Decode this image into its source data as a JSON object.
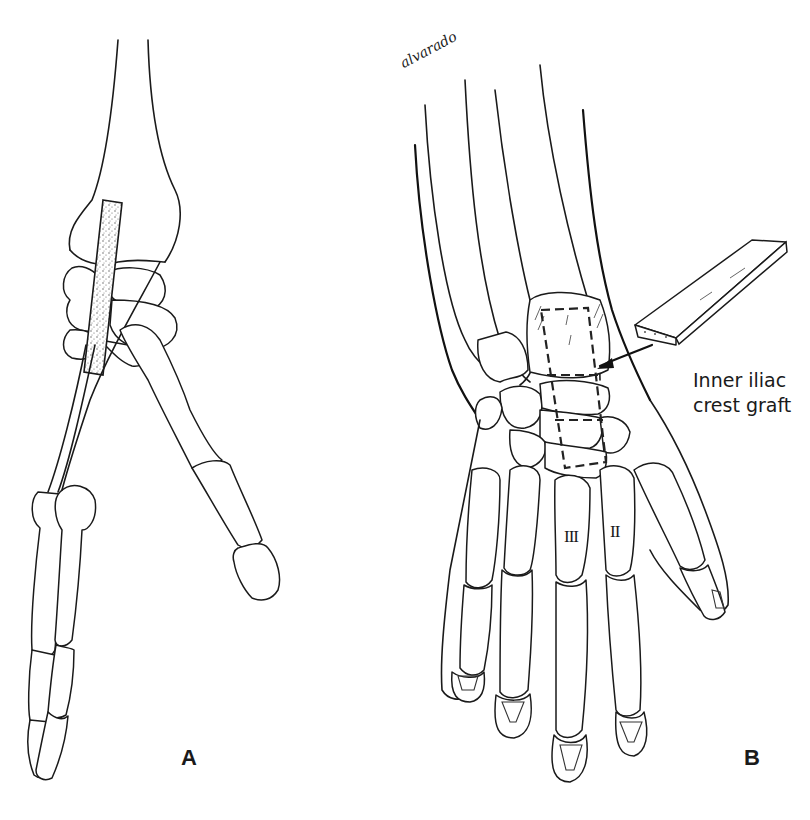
{
  "figure": {
    "signature": "alvarado",
    "panels": [
      {
        "id": "A",
        "label": "A",
        "description": "Lateral view of wrist and hand with dotted graft strip spanning the radiocarpal joint"
      },
      {
        "id": "B",
        "label": "B",
        "description": "Dorsal view of wrist and hand showing dashed graft slot spanning radius, carpus and third metacarpal base"
      }
    ],
    "callout": {
      "line1": "Inner iliac",
      "line2": "crest graft"
    },
    "metacarpal_labels": {
      "third": "III",
      "second": "II"
    },
    "colors": {
      "line": "#1a1a1a",
      "background": "#ffffff",
      "graft_stipple": "#9a9a9a"
    }
  }
}
